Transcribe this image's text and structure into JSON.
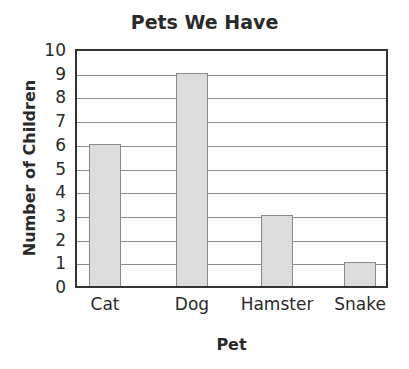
{
  "chart_data": {
    "type": "bar",
    "title": "Pets We Have",
    "xlabel": "Pet",
    "ylabel": "Number of Children",
    "categories": [
      "Cat",
      "Dog",
      "Hamster",
      "Snake"
    ],
    "values": [
      6,
      9,
      3,
      1
    ],
    "ylim": [
      0,
      10
    ],
    "yticks": [
      "0",
      "1",
      "2",
      "3",
      "4",
      "5",
      "6",
      "7",
      "8",
      "9",
      "10"
    ],
    "grid": true,
    "legend": null,
    "colors": {
      "bar_fill": "#dcdcdc",
      "bar_border": "#8a8a8a",
      "grid": "#8c8c8c",
      "axis": "#333333"
    }
  }
}
